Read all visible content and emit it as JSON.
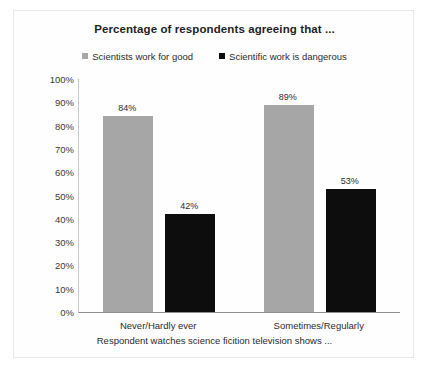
{
  "chart_data": {
    "type": "bar",
    "title": "Percentage of respondents agreeing that ...",
    "xlabel": "Respondent watches science ficition television shows ...",
    "ylabel": "",
    "ylim": [
      0,
      100
    ],
    "grid": false,
    "legend_position": "top-center",
    "categories": [
      "Never/Hardly ever",
      "Sometimes/Regularly"
    ],
    "ytick_labels": [
      "100%",
      "90%",
      "80%",
      "70%",
      "60%",
      "50%",
      "40%",
      "30%",
      "20%",
      "10%",
      "0%"
    ],
    "ytick_values": [
      100,
      90,
      80,
      70,
      60,
      50,
      40,
      30,
      20,
      10,
      0
    ],
    "series": [
      {
        "name": "Scientists work for good",
        "color": "#a6a6a6",
        "values": [
          84,
          89
        ],
        "labels": [
          "84%",
          "89%"
        ]
      },
      {
        "name": "Scientific work is dangerous",
        "color": "#0d0d0d",
        "values": [
          42,
          53
        ],
        "labels": [
          "42%",
          "53%"
        ]
      }
    ]
  },
  "legend": {
    "entries": [
      {
        "label": "Scientists work for good",
        "marker": "legend-swatch-gray"
      },
      {
        "label": "Scientific work is dangerous",
        "marker": "legend-swatch-black"
      }
    ]
  }
}
